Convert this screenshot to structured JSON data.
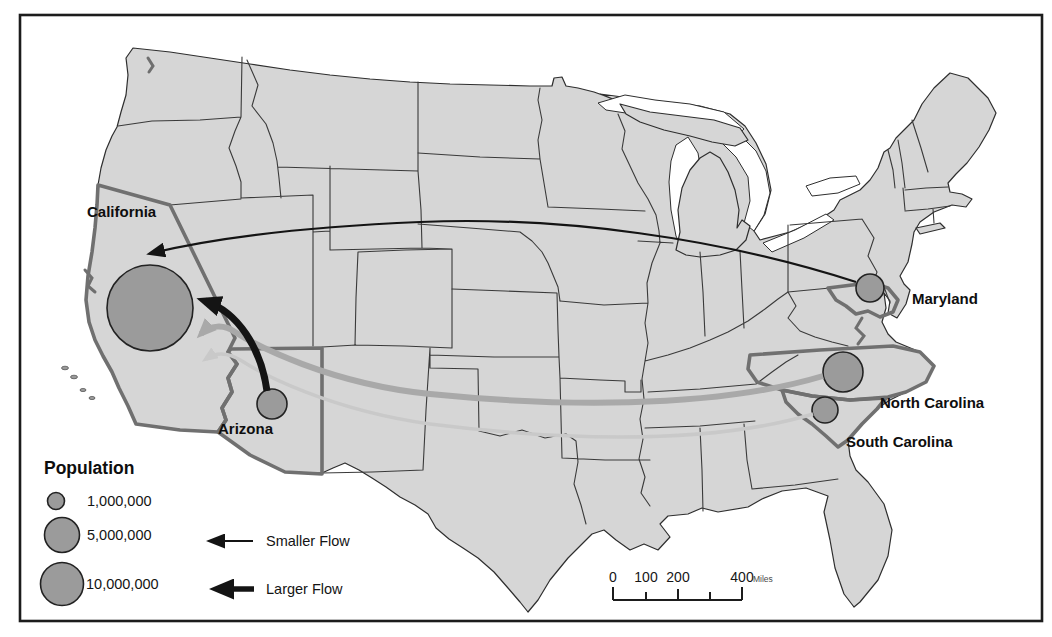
{
  "colors": {
    "background": "#ffffff",
    "frame": "#1c1c1c",
    "land": "#d6d6d6",
    "state_border": "#3a3a3a",
    "highlight_border": "#707070",
    "circle_fill": "#9b9b9b",
    "flow_black": "#141414",
    "flow_gray_medium": "#a9a9a9",
    "flow_gray_light": "#c9c9c9"
  },
  "map": {
    "states": [
      {
        "id": "california",
        "label": "California",
        "circle": {
          "r": 43
        }
      },
      {
        "id": "arizona",
        "label": "Arizona",
        "circle": {
          "r": 15
        }
      },
      {
        "id": "maryland",
        "label": "Maryland",
        "circle": {
          "r": 14
        }
      },
      {
        "id": "north-carolina",
        "label": "North Carolina",
        "circle": {
          "r": 20
        }
      },
      {
        "id": "south-carolina",
        "label": "South Carolina",
        "circle": {
          "r": 13
        }
      }
    ],
    "flows": [
      {
        "from": "Maryland",
        "to": "California",
        "style": "thin-black",
        "color": "#141414",
        "width": 2.2
      },
      {
        "from": "Arizona",
        "to": "California",
        "style": "thick-black",
        "color": "#141414",
        "width": 7
      },
      {
        "from": "North Carolina",
        "to": "California",
        "style": "medium-gray",
        "color": "#a9a9a9",
        "width": 6
      },
      {
        "from": "South Carolina",
        "to": "California",
        "style": "light-gray",
        "color": "#c9c9c9",
        "width": 3.5
      }
    ]
  },
  "legend": {
    "title": "Population",
    "sizes": [
      {
        "label": "1,000,000",
        "r": 8.5
      },
      {
        "label": "5,000,000",
        "r": 17.5
      },
      {
        "label": "10,000,000",
        "r": 21.5
      }
    ],
    "flows": [
      {
        "label": "Smaller Flow"
      },
      {
        "label": "Larger Flow"
      }
    ]
  },
  "scale_bar": {
    "ticks": [
      "0",
      "100",
      "200",
      "400"
    ],
    "unit": "Miles"
  }
}
